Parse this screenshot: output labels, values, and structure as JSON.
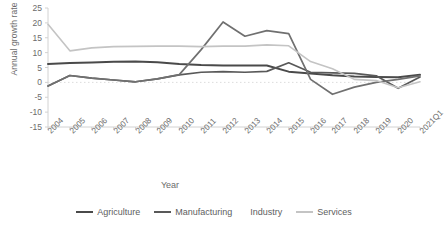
{
  "chart_data": {
    "type": "line",
    "title": "",
    "xlabel": "Year",
    "ylabel": "Annual growth rate (%)",
    "ylim": [
      -15,
      25
    ],
    "yticks": [
      25,
      20,
      15,
      10,
      5,
      0,
      -5,
      -10,
      -15
    ],
    "grid": false,
    "zero_line": true,
    "legend_position": "bottom",
    "categories": [
      "2004",
      "2005",
      "2006",
      "2007",
      "2008",
      "2009",
      "2010",
      "2011",
      "2012",
      "2013",
      "2014",
      "2015",
      "2016",
      "2017",
      "2018",
      "2019",
      "2020",
      "2021Q1"
    ],
    "series": [
      {
        "name": "Agriculture",
        "color": "#4a4a4a",
        "values": [
          6.2,
          6.5,
          6.7,
          6.9,
          7.0,
          6.8,
          6.2,
          5.8,
          5.7,
          5.7,
          5.7,
          3.6,
          3.0,
          2.4,
          2.0,
          1.8,
          1.7,
          2.6
        ]
      },
      {
        "name": "Manufacturing",
        "color": "#595959",
        "values": [
          -1.2,
          2.3,
          1.4,
          0.8,
          0.2,
          1.2,
          2.5,
          3.4,
          3.6,
          3.4,
          3.7,
          6.6,
          3.4,
          3.2,
          3.0,
          2.2,
          -2.0,
          1.8
        ]
      },
      {
        "name": "Industry",
        "color": "#707070",
        "values": [
          -1.2,
          2.3,
          1.4,
          0.8,
          0.2,
          1.2,
          2.6,
          11.0,
          20.3,
          15.5,
          17.4,
          16.4,
          1.0,
          -4.0,
          -1.6,
          0.0,
          1.0,
          2.2
        ]
      },
      {
        "name": "Services",
        "color": "#c4c4c4",
        "values": [
          19.5,
          10.6,
          11.6,
          12.0,
          12.1,
          12.2,
          12.2,
          12.0,
          12.2,
          12.2,
          12.6,
          12.3,
          7.0,
          4.6,
          1.0,
          0.6,
          -1.8,
          0.2
        ]
      }
    ]
  },
  "legend": {
    "items": [
      {
        "label": "Agriculture",
        "color": "#4a4a4a",
        "has_swatch": true
      },
      {
        "label": "Manufacturing",
        "color": "#595959",
        "has_swatch": true
      },
      {
        "label": "Industry",
        "color": "#707070",
        "has_swatch": false
      },
      {
        "label": "Services",
        "color": "#c4c4c4",
        "has_swatch": true
      }
    ]
  },
  "axes": {
    "axis_color": "#d2d2d2",
    "zero_line_color": "#dcdcdc"
  }
}
